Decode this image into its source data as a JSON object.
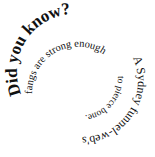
{
  "graphic": {
    "type": "spiral-text",
    "heading": "Did you know?",
    "fact_parts": [
      "A Sydney funnel-web's",
      "fangs are strong enough",
      "to pierce bone."
    ],
    "full_text": "Did you know? A Sydney funnel-web's fangs are strong enough to pierce bone.",
    "text_color": "#111111",
    "background_color": "#ffffff"
  }
}
